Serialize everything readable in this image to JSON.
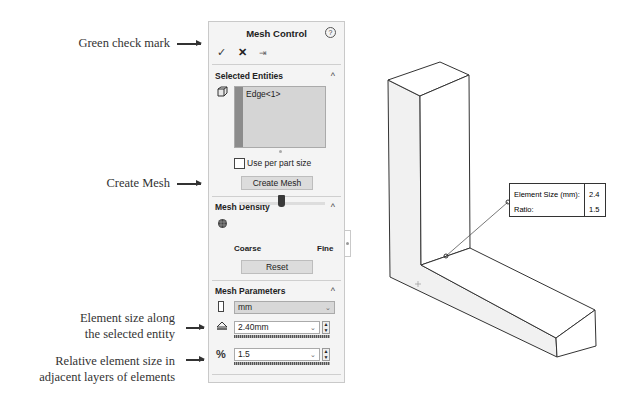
{
  "callouts": {
    "check": "Green check mark",
    "create": "Create Mesh",
    "elem_size_1": "Element size along",
    "elem_size_2": "the selected entity",
    "ratio_1": "Relative element size in",
    "ratio_2": "adjacent layers of elements"
  },
  "panel": {
    "title": "Mesh Control",
    "help_icon": "?",
    "actions": {
      "ok": "✓",
      "cancel": "✕",
      "pin": "⇥"
    },
    "selected_entities": {
      "header": "Selected Entities",
      "items": [
        "Edge<1>"
      ],
      "use_per_part_label": "Use per part size",
      "use_per_part_checked": false,
      "create_button": "Create Mesh"
    },
    "mesh_density": {
      "header": "Mesh Density",
      "coarse": "Coarse",
      "fine": "Fine",
      "reset_button": "Reset"
    },
    "mesh_parameters": {
      "header": "Mesh Parameters",
      "unit": "mm",
      "element_size": "2.40mm",
      "ratio": "1.5"
    },
    "caret": "^",
    "dropdown": "⌄"
  },
  "tooltip": {
    "rows": [
      {
        "key": "Element Size (mm):",
        "value": "2.4"
      },
      {
        "key": "Ratio:",
        "value": "1.5"
      }
    ]
  }
}
